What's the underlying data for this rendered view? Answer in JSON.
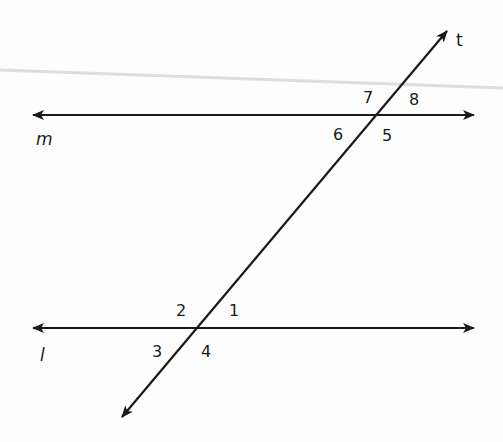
{
  "diagram": {
    "lines": {
      "m": {
        "label": "m",
        "y": 115,
        "x1": 30,
        "x2": 476
      },
      "l": {
        "label": "l",
        "y": 328,
        "x1": 30,
        "x2": 476
      },
      "t": {
        "label": "t",
        "x1": 120,
        "y1": 419,
        "x2": 449,
        "y2": 29
      }
    },
    "angles": {
      "a1": "1",
      "a2": "2",
      "a3": "3",
      "a4": "4",
      "a5": "5",
      "a6": "6",
      "a7": "7",
      "a8": "8"
    },
    "colors": {
      "line": "#1a1a1a",
      "fold_mark": "#c8c8c8",
      "background": "#fdfdfd"
    }
  }
}
